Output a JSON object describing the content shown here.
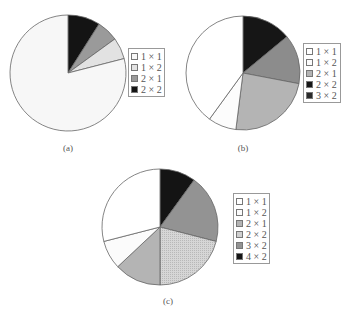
{
  "chart_data": [
    {
      "type": "pie",
      "title": "",
      "caption": "(a)",
      "legend_position": "right",
      "categories": [
        "1 × 1",
        "1 × 2",
        "2 × 1",
        "2 × 2"
      ],
      "values": [
        79,
        6,
        6,
        9
      ],
      "colors": [
        "#f7f7f7",
        "#e2e2e2",
        "#9a9a9a",
        "#141414"
      ],
      "slice_order_clockwise_from_top": [
        "2 × 2",
        "2 × 1",
        "1 × 2",
        "1 × 1"
      ]
    },
    {
      "type": "pie",
      "title": "",
      "caption": "(b)",
      "legend_position": "right",
      "categories": [
        "1 × 1",
        "1 × 2",
        "2 × 1",
        "2 × 2",
        "3 × 2"
      ],
      "values": [
        40,
        8,
        24,
        14,
        14
      ],
      "colors": [
        "#ffffff",
        "#fcfcfc",
        "#b4b4b4",
        "#8c8c8c",
        "#161616"
      ],
      "slice_order_clockwise_from_top": [
        "3 × 2",
        "2 × 2",
        "2 × 1",
        "1 × 2",
        "1 × 1"
      ]
    },
    {
      "type": "pie",
      "title": "",
      "caption": "(c)",
      "legend_position": "right",
      "categories": [
        "1 × 1",
        "1 × 2",
        "2 × 1",
        "2 × 2",
        "3 × 2",
        "4 × 2"
      ],
      "values": [
        29,
        8,
        13,
        21,
        19,
        10
      ],
      "colors": [
        "#ffffff",
        "#fbfbfb",
        "#b4b4b4",
        "#cfcfcf",
        "#939393",
        "#141414"
      ],
      "slice_order_clockwise_from_top": [
        "4 × 2",
        "3 × 2",
        "2 × 2",
        "2 × 1",
        "1 × 2",
        "1 × 1"
      ]
    }
  ],
  "panels": [
    {
      "caption": "(a)",
      "cx": 68,
      "cy": 73,
      "r": 58,
      "legend": {
        "x": 128,
        "y": 48,
        "w": 37,
        "items": [
          {
            "label": "1 × 1",
            "color": "#f7f7f7"
          },
          {
            "label": "1 × 2",
            "color": "#e2e2e2"
          },
          {
            "label": "2 × 1",
            "color": "#9a9a9a"
          },
          {
            "label": "2 × 2",
            "color": "#141414"
          }
        ]
      },
      "caption_pos": {
        "x": 53,
        "y": 143
      }
    },
    {
      "caption": "(b)",
      "cx": 243,
      "cy": 73,
      "r": 57,
      "legend": {
        "x": 303,
        "y": 43,
        "w": 38,
        "items": [
          {
            "label": "1 × 1",
            "color": "#ffffff"
          },
          {
            "label": "1 × 2",
            "color": "#fcfcfc"
          },
          {
            "label": "2 × 1",
            "color": "#b4b4b4"
          },
          {
            "label": "2 × 2",
            "color": "#161616"
          },
          {
            "label": "3 × 2",
            "color": "#2a2a2a"
          }
        ]
      },
      "caption_pos": {
        "x": 228,
        "y": 143
      }
    },
    {
      "caption": "(c)",
      "cx": 160,
      "cy": 227,
      "r": 58,
      "legend": {
        "x": 233,
        "y": 193,
        "w": 37,
        "items": [
          {
            "label": "1 × 1",
            "color": "#ffffff"
          },
          {
            "label": "1 × 2",
            "color": "#fbfbfb"
          },
          {
            "label": "2 × 1",
            "color": "#b4b4b4"
          },
          {
            "label": "2 × 2",
            "color": "#cfcfcf"
          },
          {
            "label": "3 × 2",
            "color": "#939393"
          },
          {
            "label": "4 × 2",
            "color": "#141414"
          }
        ]
      },
      "caption_pos": {
        "x": 153,
        "y": 296
      }
    }
  ],
  "captions": {
    "a": "(a)",
    "b": "(b)",
    "c": "(c)"
  }
}
